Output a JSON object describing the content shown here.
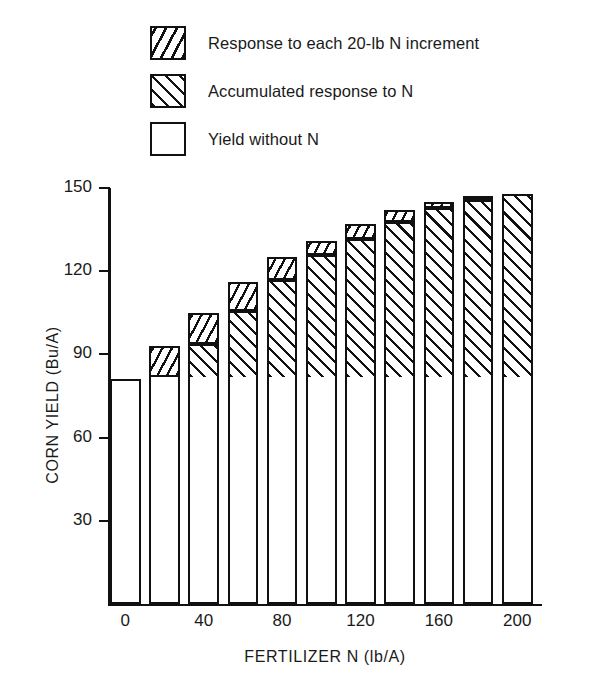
{
  "legend": {
    "items": [
      {
        "swatch": "hatch-increment",
        "label": "Response to each 20-lb N increment"
      },
      {
        "swatch": "hatch-accum",
        "label": "Accumulated response to N"
      },
      {
        "swatch": "plain",
        "label": "Yield without N"
      }
    ]
  },
  "axes": {
    "ylabel": "CORN YIELD (Bu/A)",
    "xlabel": "FERTILIZER N (lb/A)",
    "yticks": [
      "30",
      "60",
      "90",
      "120",
      "150"
    ],
    "xticks": [
      "0",
      "40",
      "80",
      "120",
      "160",
      "200"
    ]
  },
  "chart_data": {
    "type": "bar",
    "title": "",
    "subtitle": "",
    "xlabel": "FERTILIZER N (lb/A)",
    "ylabel": "CORN YIELD (Bu/A)",
    "xlim": [
      -10,
      210
    ],
    "ylim": [
      0,
      150
    ],
    "ytick_values": [
      30,
      60,
      90,
      120,
      150
    ],
    "xtick_values": [
      0,
      40,
      80,
      120,
      160,
      200
    ],
    "grid": false,
    "legend_position": "above-plot",
    "stacked": true,
    "categories": [
      0,
      20,
      40,
      60,
      80,
      100,
      120,
      140,
      160,
      180,
      200
    ],
    "base_yield": 81,
    "total_yield": [
      81,
      93,
      105,
      116,
      125,
      131,
      137,
      142,
      145,
      147,
      148
    ],
    "series": [
      {
        "name": "Yield without N",
        "pattern": "plain",
        "values": [
          81,
          81,
          81,
          81,
          81,
          81,
          81,
          81,
          81,
          81,
          81
        ]
      },
      {
        "name": "Accumulated response to N",
        "pattern": "hatch-accum",
        "values": [
          0,
          0,
          12,
          24,
          35,
          44,
          50,
          56,
          61,
          64,
          66
        ]
      },
      {
        "name": "Response to each 20-lb N increment",
        "pattern": "hatch-increment",
        "values": [
          0,
          12,
          12,
          11,
          9,
          6,
          6,
          5,
          3,
          2,
          1
        ]
      }
    ]
  }
}
